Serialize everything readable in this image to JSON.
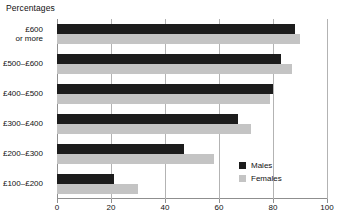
{
  "chart_data": {
    "type": "bar",
    "orientation": "horizontal",
    "title": "Percentages",
    "xlabel": "",
    "ylabel": "",
    "xlim": [
      0,
      100
    ],
    "xticks": [
      0,
      20,
      40,
      60,
      80,
      100
    ],
    "xtick_labels": [
      "0",
      "20",
      "40",
      "60",
      "80",
      "100"
    ],
    "grid": true,
    "grid_axis": "x",
    "legend_position": "inside-bottom-right",
    "categories": [
      "£600\nor more",
      "£500–£600",
      "£400–£500",
      "£300–£400",
      "£200–£300",
      "£100–£200"
    ],
    "series": [
      {
        "name": "Males",
        "color": "#1c1c1c",
        "values": [
          88,
          83,
          80,
          67,
          47,
          21
        ]
      },
      {
        "name": "Females",
        "color": "#c4c4c4",
        "values": [
          90,
          87,
          79,
          72,
          58,
          30
        ]
      }
    ]
  },
  "categories_display": [
    {
      "line1": "£600",
      "line2": "or more"
    },
    {
      "line1": "£500–£600",
      "line2": ""
    },
    {
      "line1": "£400–£500",
      "line2": ""
    },
    {
      "line1": "£300–£400",
      "line2": ""
    },
    {
      "line1": "£200–£300",
      "line2": ""
    },
    {
      "line1": "£100–£200",
      "line2": ""
    }
  ],
  "legend": {
    "items": [
      {
        "label": "Males",
        "color": "#1c1c1c"
      },
      {
        "label": "Females",
        "color": "#c4c4c4"
      }
    ]
  },
  "colors": {
    "males": "#1c1c1c",
    "females": "#c4c4c4",
    "axis": "#8f8f8f",
    "grid": "#b3b3b3",
    "text": "#111111",
    "background": "#ffffff"
  }
}
